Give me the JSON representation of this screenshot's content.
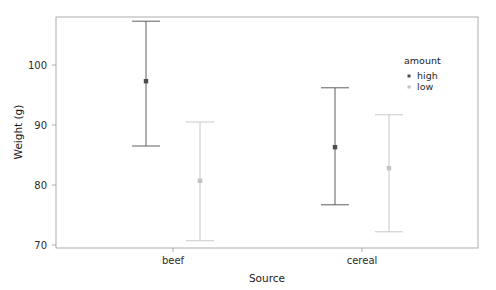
{
  "chart_data": {
    "type": "scatter",
    "title": "",
    "subtitle": "",
    "xlabel": "Source",
    "ylabel": "Weight (g)",
    "categories": [
      "beef",
      "cereal"
    ],
    "xtick_labels": [
      "beef",
      "cereal"
    ],
    "ytick_labels": [
      "70",
      "80",
      "90",
      "100"
    ],
    "yticks": [
      70,
      80,
      90,
      100
    ],
    "ylim": [
      69.5,
      108.5
    ],
    "grid": false,
    "legend": {
      "title": "amount",
      "position": "right",
      "entries": [
        {
          "label": "high",
          "color": "#4d4d4d"
        },
        {
          "label": "low",
          "color": "#c2c2c2"
        }
      ]
    },
    "error_bar_style": "capped",
    "series": [
      {
        "name": "high",
        "color": "#4d4d4d",
        "points": [
          {
            "category": "beef",
            "value": 97.3,
            "low": 86.5,
            "high": 107.3
          },
          {
            "category": "cereal",
            "value": 86.3,
            "low": 76.7,
            "high": 96.2
          }
        ]
      },
      {
        "name": "low",
        "color": "#c2c2c2",
        "points": [
          {
            "category": "beef",
            "value": 80.7,
            "low": 70.7,
            "high": 90.5
          },
          {
            "category": "cereal",
            "value": 82.8,
            "low": 72.2,
            "high": 91.7
          }
        ]
      }
    ]
  },
  "axes": {
    "y_title": "Weight (g)",
    "x_title": "Source",
    "y_tick_0": "70",
    "y_tick_1": "80",
    "y_tick_2": "90",
    "y_tick_3": "100",
    "x_tick_0": "beef",
    "x_tick_1": "cereal"
  },
  "legend": {
    "title": "amount",
    "item_0": "high",
    "item_1": "low"
  },
  "colors": {
    "high": "#4d4d4d",
    "low": "#c2c2c2",
    "frame": "#9a9a9a",
    "text": "#1a1a1a",
    "background": "#ffffff"
  }
}
